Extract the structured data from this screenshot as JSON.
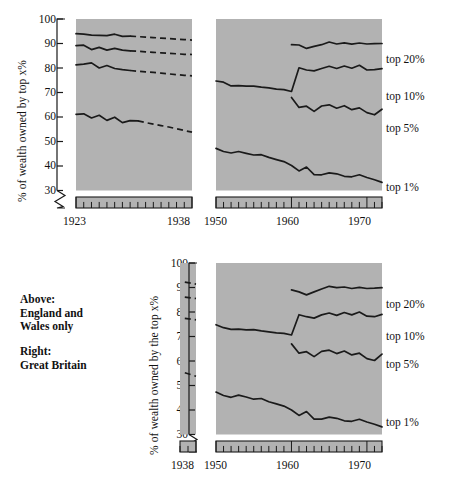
{
  "figure": {
    "title": "",
    "notes": [
      {
        "id": "note-above",
        "text": "Above:\nEngland and\nWales only"
      },
      {
        "id": "note-right",
        "text": "Right:\nGreat Britain"
      }
    ],
    "colors": {
      "panel_background": "#b2b2b2",
      "line": "#1a1a1a",
      "page_background": "#ffffff"
    }
  },
  "chart_data": [
    {
      "id": "chart-top",
      "type": "line",
      "title": "",
      "subtitle": "",
      "region": "England and Wales only",
      "ylabel": "% of wealth owned by top x%",
      "xlabel": "",
      "ylim": [
        28,
        100
      ],
      "yticks": [
        100,
        90,
        80,
        70,
        60,
        50,
        40,
        30
      ],
      "y_axis_break": true,
      "grid": false,
      "legend_position": "right",
      "panels": [
        {
          "id": "panel-1923-1938",
          "xlim": [
            1923,
            1938
          ],
          "xticks": [
            1923,
            1938
          ],
          "xtick_labels": [
            "1923",
            "1938"
          ],
          "minor_tick_interval": 1,
          "series": [
            {
              "name": "top 20%",
              "label_shown": false,
              "x": [
                1923,
                1924,
                1925,
                1926,
                1927,
                1928,
                1929,
                1930,
                1931,
                1932,
                1933,
                1934,
                1935,
                1936,
                1937,
                1938
              ],
              "values": [
                94.0,
                93.8,
                93.4,
                93.3,
                93.2,
                93.8,
                92.9,
                93.0,
                92.8,
                92.6,
                92.4,
                92.2,
                92.0,
                91.8,
                91.6,
                91.4
              ],
              "solid_until": 1930,
              "dashed_from": 1930
            },
            {
              "name": "top 10%",
              "label_shown": false,
              "x": [
                1923,
                1924,
                1925,
                1926,
                1927,
                1928,
                1929,
                1930,
                1931,
                1932,
                1933,
                1934,
                1935,
                1936,
                1937,
                1938
              ],
              "values": [
                89.1,
                89.3,
                87.5,
                88.4,
                87.3,
                88.0,
                87.3,
                87.0,
                86.8,
                86.6,
                86.4,
                86.2,
                86.0,
                85.8,
                85.6,
                85.5
              ],
              "solid_until": 1930,
              "dashed_from": 1930
            },
            {
              "name": "top 5%",
              "label_shown": false,
              "x": [
                1923,
                1924,
                1925,
                1926,
                1927,
                1928,
                1929,
                1930,
                1931,
                1932,
                1933,
                1934,
                1935,
                1936,
                1937,
                1938
              ],
              "values": [
                81.3,
                81.6,
                82.1,
                80.0,
                81.0,
                79.8,
                79.3,
                79.0,
                78.7,
                78.4,
                78.2,
                77.9,
                77.6,
                77.3,
                77.0,
                76.8
              ],
              "solid_until": 1930,
              "dashed_from": 1930
            },
            {
              "name": "top 1%",
              "label_shown": false,
              "x": [
                1923,
                1924,
                1925,
                1926,
                1927,
                1928,
                1929,
                1930,
                1931,
                1932,
                1933,
                1934,
                1935,
                1936,
                1937,
                1938
              ],
              "values": [
                61.1,
                61.3,
                59.6,
                60.7,
                58.6,
                59.9,
                57.7,
                58.5,
                58.4,
                57.7,
                57.1,
                56.5,
                55.9,
                55.2,
                54.5,
                53.8
              ],
              "solid_until": 1931,
              "dashed_from": 1931
            }
          ]
        },
        {
          "id": "panel-1950-1972",
          "xlim": [
            1950,
            1972
          ],
          "xticks": [
            1950,
            1960,
            1970
          ],
          "xtick_labels": [
            "1950",
            "1960",
            "1970"
          ],
          "minor_tick_interval": 1,
          "series": [
            {
              "name": "top 20%",
              "label_shown": true,
              "x": [
                1960,
                1961,
                1962,
                1963,
                1964,
                1965,
                1966,
                1967,
                1968,
                1969,
                1970,
                1971,
                1972
              ],
              "values": [
                89.5,
                89.4,
                88.0,
                88.8,
                89.5,
                90.6,
                89.8,
                90.3,
                89.7,
                90.2,
                89.8,
                89.9,
                90.0
              ],
              "solid_until": 1972,
              "dashed_from": null
            },
            {
              "name": "top 10%",
              "label_shown": true,
              "x": [
                1950,
                1951,
                1952,
                1953,
                1954,
                1955,
                1956,
                1957,
                1958,
                1959,
                1960,
                1961,
                1962,
                1963,
                1964,
                1965,
                1966,
                1967,
                1968,
                1969,
                1970,
                1971,
                1972
              ],
              "values": [
                74.7,
                74.2,
                72.7,
                72.8,
                72.6,
                72.6,
                72.2,
                71.9,
                71.4,
                71.2,
                70.4,
                80.1,
                79.2,
                78.8,
                79.8,
                80.7,
                79.8,
                80.8,
                79.9,
                81.1,
                79.2,
                79.3,
                79.7
              ],
              "solid_until": 1972,
              "dashed_from": null
            },
            {
              "name": "top 5%",
              "label_shown": true,
              "x": [
                1960,
                1961,
                1962,
                1963,
                1964,
                1965,
                1966,
                1967,
                1968,
                1969,
                1970,
                1971,
                1972
              ],
              "values": [
                68.0,
                63.9,
                64.4,
                62.3,
                64.5,
                65.0,
                63.6,
                64.6,
                63.0,
                63.7,
                61.8,
                60.9,
                63.2
              ],
              "solid_until": 1972,
              "dashed_from": null
            },
            {
              "name": "top 1%",
              "label_shown": true,
              "x": [
                1950,
                1951,
                1952,
                1953,
                1954,
                1955,
                1956,
                1957,
                1958,
                1959,
                1960,
                1961,
                1962,
                1963,
                1964,
                1965,
                1966,
                1967,
                1968,
                1969,
                1970,
                1971,
                1972
              ],
              "values": [
                47.2,
                45.9,
                45.3,
                45.9,
                45.2,
                44.5,
                44.6,
                43.5,
                42.6,
                41.8,
                40.2,
                38.0,
                39.6,
                36.5,
                36.4,
                37.2,
                36.8,
                35.8,
                35.6,
                36.4,
                35.3,
                34.4,
                33.3
              ],
              "solid_until": 1972,
              "dashed_from": null
            }
          ]
        }
      ],
      "series_labels": [
        "top 20%",
        "top 10%",
        "top 5%",
        "top 1%"
      ]
    },
    {
      "id": "chart-bottom",
      "type": "line",
      "title": "",
      "subtitle": "",
      "region": "Great Britain",
      "ylabel": "% of wealth owned by the top x%",
      "xlabel": "",
      "ylim": [
        28,
        100
      ],
      "yticks": [
        100,
        90,
        80,
        70,
        60,
        50,
        40,
        30
      ],
      "y_axis_break": true,
      "grid": false,
      "legend_position": "right",
      "panels": [
        {
          "id": "panel-1938-stub",
          "xlim": [
            1936,
            1938
          ],
          "xticks": [
            1938
          ],
          "xtick_labels": [
            "1938"
          ],
          "minor_tick_interval": 1,
          "series": [
            {
              "name": "top 20%",
              "label_shown": false,
              "x": [
                1936.6,
                1938
              ],
              "values": [
                92.2,
                91.4
              ],
              "solid_until": null,
              "dashed_from": 1936.6
            },
            {
              "name": "top 10%",
              "label_shown": false,
              "x": [
                1936.6,
                1938
              ],
              "values": [
                86.1,
                85.5
              ],
              "solid_until": null,
              "dashed_from": 1936.6
            },
            {
              "name": "top 5%",
              "label_shown": false,
              "x": [
                1936.6,
                1938
              ],
              "values": [
                77.4,
                76.8
              ],
              "solid_until": null,
              "dashed_from": 1936.6
            },
            {
              "name": "top 1%",
              "label_shown": false,
              "x": [
                1936.6,
                1938
              ],
              "values": [
                55.2,
                53.8
              ],
              "solid_until": null,
              "dashed_from": 1936.6
            }
          ]
        },
        {
          "id": "panel-1950-1972",
          "xlim": [
            1950,
            1972
          ],
          "xticks": [
            1950,
            1960,
            1970
          ],
          "xtick_labels": [
            "1950",
            "1960",
            "1970"
          ],
          "minor_tick_interval": 1,
          "series": [
            {
              "name": "top 20%",
              "label_shown": true,
              "x": [
                1960,
                1961,
                1962,
                1963,
                1964,
                1965,
                1966,
                1967,
                1968,
                1969,
                1970,
                1971,
                1972
              ],
              "values": [
                89.0,
                88.2,
                87.0,
                88.2,
                89.4,
                90.5,
                89.9,
                90.2,
                89.6,
                90.1,
                89.6,
                89.7,
                89.9
              ],
              "solid_until": 1972,
              "dashed_from": null
            },
            {
              "name": "top 10%",
              "label_shown": true,
              "x": [
                1950,
                1951,
                1952,
                1953,
                1954,
                1955,
                1956,
                1957,
                1958,
                1959,
                1960,
                1961,
                1962,
                1963,
                1964,
                1965,
                1966,
                1967,
                1968,
                1969,
                1970,
                1971,
                1972
              ],
              "values": [
                74.8,
                73.6,
                72.9,
                73.0,
                72.7,
                72.8,
                72.3,
                71.9,
                71.5,
                71.3,
                70.6,
                78.9,
                78.1,
                77.5,
                78.8,
                79.6,
                78.6,
                79.8,
                78.8,
                80.0,
                78.3,
                78.1,
                79.0
              ],
              "solid_until": 1972,
              "dashed_from": null
            },
            {
              "name": "top 5%",
              "label_shown": true,
              "x": [
                1960,
                1961,
                1962,
                1963,
                1964,
                1965,
                1966,
                1967,
                1968,
                1969,
                1970,
                1971,
                1972
              ],
              "values": [
                67.0,
                63.2,
                63.8,
                61.8,
                63.9,
                64.4,
                63.0,
                64.1,
                62.5,
                63.2,
                61.0,
                60.2,
                62.8
              ],
              "solid_until": 1972,
              "dashed_from": null
            },
            {
              "name": "top 1%",
              "label_shown": true,
              "x": [
                1950,
                1951,
                1952,
                1953,
                1954,
                1955,
                1956,
                1957,
                1958,
                1959,
                1960,
                1961,
                1962,
                1963,
                1964,
                1965,
                1966,
                1967,
                1968,
                1969,
                1970,
                1971,
                1972
              ],
              "values": [
                47.3,
                45.9,
                45.2,
                46.1,
                45.3,
                44.4,
                44.7,
                43.4,
                42.5,
                41.6,
                40.0,
                37.8,
                39.4,
                36.3,
                36.3,
                37.1,
                36.6,
                35.6,
                35.4,
                36.2,
                35.1,
                34.2,
                33.1
              ],
              "solid_until": 1972,
              "dashed_from": null
            }
          ]
        }
      ],
      "series_labels": [
        "top 20%",
        "top 10%",
        "top 5%",
        "top 1%"
      ]
    }
  ]
}
